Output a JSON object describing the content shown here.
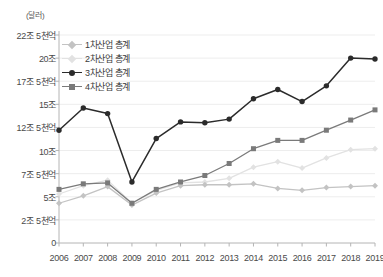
{
  "chart_data": {
    "type": "line",
    "title": "",
    "subtitle": "",
    "unit_label": "(달러)",
    "xlabel": "",
    "ylabel": "",
    "grid": true,
    "legend_position": "top-left-inside",
    "categories": [
      "2006",
      "2007",
      "2008",
      "2009",
      "2010",
      "2011",
      "2012",
      "2013",
      "2014",
      "2015",
      "2016",
      "2017",
      "2018",
      "2019"
    ],
    "ylim": [
      0,
      22.5
    ],
    "yticks": [
      0,
      2.5,
      5,
      7.5,
      10,
      12.5,
      15,
      17.5,
      20,
      22.5
    ],
    "ytick_labels": [
      "0",
      "2조 5천억",
      "5조",
      "7조 5천억",
      "10조",
      "12조 5천억",
      "15조",
      "17조 5천억",
      "20조",
      "22조 5천억"
    ],
    "series": [
      {
        "name": "1차산업 총계",
        "color": "#c3c3c3",
        "marker": "diamond",
        "values": [
          4.3,
          5.1,
          6.1,
          4.1,
          5.4,
          6.2,
          6.3,
          6.3,
          6.4,
          5.9,
          5.7,
          6.0,
          6.1,
          6.2
        ]
      },
      {
        "name": "2차산업 총계",
        "color": "#e2e2e2",
        "marker": "diamond",
        "values": [
          5.3,
          6.2,
          6.8,
          4.3,
          5.7,
          6.5,
          6.6,
          7.0,
          8.2,
          8.8,
          8.1,
          9.2,
          10.1,
          10.2
        ]
      },
      {
        "name": "3차산업 총계",
        "color": "#2b2b2b",
        "marker": "circle",
        "values": [
          12.2,
          14.6,
          14.0,
          6.6,
          11.3,
          13.1,
          13.0,
          13.4,
          15.6,
          16.6,
          15.3,
          17.0,
          20.0,
          19.9
        ]
      },
      {
        "name": "4차산업 총계",
        "color": "#7a7a7a",
        "marker": "square",
        "values": [
          5.8,
          6.4,
          6.5,
          4.3,
          5.8,
          6.6,
          7.3,
          8.6,
          10.2,
          11.1,
          11.1,
          12.2,
          13.3,
          14.4
        ]
      }
    ]
  },
  "legend": {
    "items": [
      {
        "label": "1차산업 총계"
      },
      {
        "label": "2차산업 총계"
      },
      {
        "label": "3차산업 총계"
      },
      {
        "label": "4차산업 총계"
      }
    ]
  }
}
